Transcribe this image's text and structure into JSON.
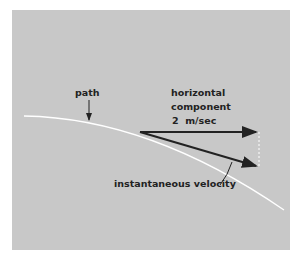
{
  "labels": {
    "path": "path",
    "horizontal_line1": "horizontal",
    "horizontal_line2": "component",
    "horizontal_value": "2  m/sec",
    "velocity": "instantaneous velocity"
  },
  "colors": {
    "panel": "#c8c8c8",
    "path": "#ffffff",
    "arrows": "#222222"
  }
}
